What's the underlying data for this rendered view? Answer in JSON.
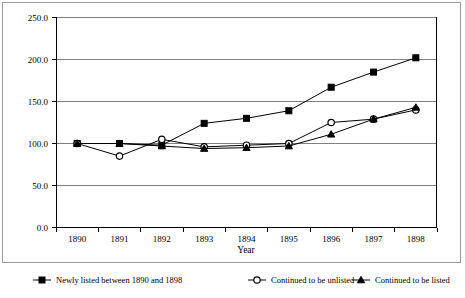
{
  "chart_data": {
    "type": "line",
    "title": "",
    "xlabel": "Year",
    "ylabel": "",
    "categories": [
      "1890",
      "1891",
      "1892",
      "1893",
      "1894",
      "1895",
      "1896",
      "1897",
      "1898"
    ],
    "x": [
      1890,
      1891,
      1892,
      1893,
      1894,
      1895,
      1896,
      1897,
      1898
    ],
    "ylim": [
      0.0,
      250.0
    ],
    "yticks": [
      0.0,
      50.0,
      100.0,
      150.0,
      200.0,
      250.0
    ],
    "ytick_labels": [
      "0.0",
      "50.0",
      "100.0",
      "150.0",
      "200.0",
      "250.0"
    ],
    "grid": true,
    "legend_position": "bottom",
    "series": [
      {
        "name": "Newly listed between 1890 and 1898",
        "marker": "filled-square",
        "values": [
          100,
          100,
          98,
          124,
          130,
          139,
          167,
          185,
          202
        ]
      },
      {
        "name": "Continued to be unlisted",
        "marker": "open-circle",
        "values": [
          100,
          85,
          105,
          96,
          98,
          100,
          125,
          129,
          140
        ]
      },
      {
        "name": "Continued to be listed",
        "marker": "filled-triangle",
        "values": [
          100,
          100,
          97,
          94,
          95,
          97,
          111,
          129,
          143
        ]
      }
    ]
  },
  "legend": {
    "items": [
      {
        "label": "Newly listed between 1890 and 1898",
        "marker": "filled-square"
      },
      {
        "label": "Continued to be unlisted",
        "marker": "open-circle"
      },
      {
        "label": "Continued to be listed",
        "marker": "filled-triangle"
      }
    ]
  },
  "axes": {
    "x_title": "Year",
    "x_tick_labels": [
      "1890",
      "1891",
      "1892",
      "1893",
      "1894",
      "1895",
      "1896",
      "1897",
      "1898"
    ],
    "y_tick_labels": [
      "250.0",
      "200.0",
      "150.0",
      "100.0",
      "50.0",
      "0.0"
    ]
  },
  "colors": {
    "line": "#000000",
    "grid": "#808080",
    "axis": "#000000",
    "frame": "#9a9a9a",
    "background": "#ffffff"
  }
}
